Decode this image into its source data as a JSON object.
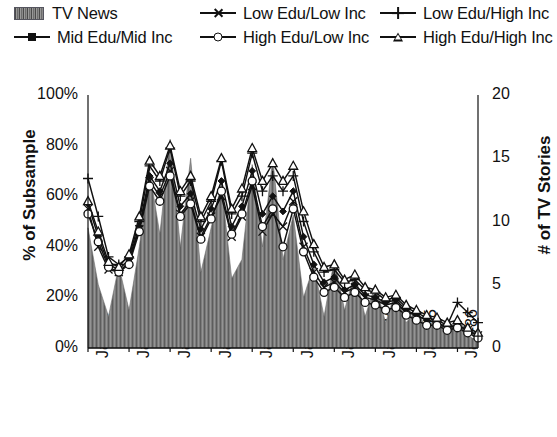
{
  "legend": {
    "items": [
      {
        "label": "TV News",
        "marker": "area-swatch",
        "row": 0,
        "col": 0
      },
      {
        "label": "Low Edu/Low Inc",
        "marker": "x-marker",
        "row": 0,
        "col": 1
      },
      {
        "label": "Low Edu/High Inc",
        "marker": "plus-marker",
        "row": 0,
        "col": 2
      },
      {
        "label": "Mid Edu/Mid Inc",
        "marker": "diamond-marker",
        "row": 1,
        "col": 0
      },
      {
        "label": "High Edu/Low Inc",
        "marker": "circle-marker",
        "row": 1,
        "col": 1
      },
      {
        "label": "High Edu/High Inc",
        "marker": "triangle-marker",
        "row": 1,
        "col": 2
      }
    ]
  },
  "axes": {
    "left": {
      "title": "% of Subsample",
      "ticks": [
        "100%",
        "80%",
        "60%",
        "40%",
        "20%",
        "0%"
      ],
      "min": 0,
      "max": 100,
      "step": 20
    },
    "right": {
      "title": "# of TV Stories",
      "ticks": [
        "20",
        "15",
        "10",
        "5",
        "0"
      ],
      "min": 0,
      "max": 20,
      "step": 5
    },
    "bottom": {
      "ticks": [
        "Jan-77",
        "Jan-78",
        "Jan-79",
        "Jan-80",
        "Jan-81",
        "Jan-82",
        "Jan-83",
        "Jan-84",
        "Jan-85",
        "Jan-86"
      ]
    }
  },
  "colors": {
    "area_fill": "#7b7b7b",
    "line": "#111111",
    "text": "#1a1a1a",
    "background": "#ffffff"
  },
  "chart_data": {
    "type": "line",
    "title": "",
    "xlabel": "",
    "ylabel": "% of Subsample",
    "y2label": "# of TV Stories",
    "ylim": [
      0,
      100
    ],
    "y2lim": [
      0,
      20
    ],
    "grid": false,
    "legend_position": "top",
    "x": [
      "Jan-77",
      "Apr-77",
      "Jul-77",
      "Oct-77",
      "Jan-78",
      "Apr-78",
      "Jul-78",
      "Oct-78",
      "Jan-79",
      "Apr-79",
      "Jul-79",
      "Oct-79",
      "Jan-80",
      "Apr-80",
      "Jul-80",
      "Oct-80",
      "Jan-81",
      "Apr-81",
      "Jul-81",
      "Oct-81",
      "Jan-82",
      "Apr-82",
      "Jul-82",
      "Oct-82",
      "Jan-83",
      "Apr-83",
      "Jul-83",
      "Oct-83",
      "Jan-84",
      "Apr-84",
      "Jul-84",
      "Oct-84",
      "Jan-85",
      "Apr-85",
      "Jul-85",
      "Oct-85",
      "Jan-86",
      "Apr-86",
      "Jul-86"
    ],
    "series": [
      {
        "name": "TV News",
        "axis": "right",
        "type": "area",
        "values": [
          9.5,
          5.0,
          2.5,
          6.5,
          3.0,
          8.0,
          14.0,
          9.0,
          16.5,
          8.0,
          15.0,
          6.0,
          9.5,
          13.0,
          5.5,
          7.0,
          14.5,
          8.0,
          15.0,
          7.0,
          10.5,
          4.0,
          6.5,
          2.5,
          7.0,
          3.0,
          6.0,
          2.5,
          5.0,
          2.0,
          4.5,
          2.0,
          3.0,
          1.5,
          2.5,
          1.0,
          2.5,
          1.0,
          0.5
        ]
      },
      {
        "name": "Low Edu/Low Inc",
        "axis": "left",
        "marker": "x",
        "values": [
          55,
          40,
          31,
          30,
          34,
          47,
          66,
          60,
          70,
          53,
          58,
          44,
          52,
          60,
          44,
          52,
          64,
          46,
          53,
          48,
          58,
          40,
          30,
          24,
          26,
          22,
          24,
          20,
          19,
          17,
          18,
          14,
          13,
          11,
          10,
          8,
          9,
          7,
          5
        ]
      },
      {
        "name": "Low Edu/High Inc",
        "axis": "left",
        "marker": "plus",
        "values": [
          67,
          52,
          36,
          33,
          36,
          50,
          72,
          66,
          79,
          60,
          66,
          50,
          58,
          74,
          53,
          60,
          77,
          62,
          68,
          62,
          68,
          50,
          38,
          30,
          31,
          26,
          27,
          23,
          22,
          19,
          20,
          16,
          14,
          12,
          11,
          9,
          18,
          14,
          10
        ]
      },
      {
        "name": "Mid Edu/Mid Inc",
        "axis": "left",
        "marker": "diamond",
        "values": [
          57,
          44,
          33,
          31,
          35,
          48,
          68,
          62,
          73,
          56,
          61,
          47,
          55,
          66,
          48,
          56,
          70,
          53,
          60,
          54,
          62,
          44,
          33,
          26,
          28,
          23,
          25,
          21,
          20,
          18,
          19,
          15,
          13,
          11,
          10,
          8,
          9,
          7,
          5
        ]
      },
      {
        "name": "High Edu/Low Inc",
        "axis": "left",
        "marker": "circle",
        "values": [
          53,
          42,
          32,
          30,
          33,
          46,
          64,
          58,
          68,
          52,
          57,
          43,
          51,
          62,
          45,
          53,
          66,
          48,
          55,
          40,
          55,
          38,
          28,
          22,
          24,
          20,
          22,
          18,
          17,
          15,
          16,
          13,
          11,
          9,
          9,
          7,
          8,
          6,
          4
        ]
      },
      {
        "name": "High Edu/High Inc",
        "axis": "left",
        "marker": "triangle",
        "values": [
          58,
          46,
          34,
          32,
          37,
          52,
          74,
          68,
          80,
          62,
          68,
          52,
          60,
          75,
          55,
          63,
          79,
          66,
          73,
          66,
          72,
          54,
          41,
          32,
          33,
          27,
          29,
          24,
          23,
          20,
          21,
          17,
          15,
          13,
          12,
          10,
          11,
          8,
          6
        ]
      }
    ]
  }
}
